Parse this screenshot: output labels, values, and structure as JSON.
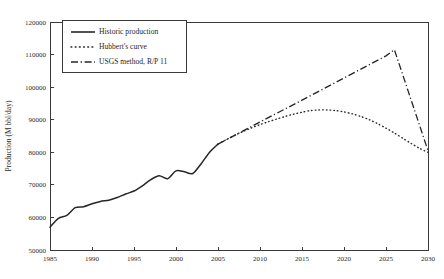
{
  "chart_data": {
    "type": "line",
    "title": "",
    "xlabel": "",
    "ylabel": "Production (M bbl/day)",
    "xlim": [
      1985,
      2030
    ],
    "ylim": [
      50000,
      120000
    ],
    "xticks": [
      1985,
      1990,
      1995,
      2000,
      2005,
      2010,
      2015,
      2020,
      2025,
      2030
    ],
    "xticklabels": [
      "1985",
      "1990",
      "1995",
      "2000",
      "2005",
      "2010",
      "2015",
      "2020",
      "2025",
      "2030"
    ],
    "yticks": [
      50000,
      60000,
      70000,
      80000,
      90000,
      100000,
      110000,
      120000
    ],
    "yticklabels": [
      "50000",
      "60000",
      "70000",
      "80000",
      "90000",
      "100000",
      "110000",
      "120000"
    ],
    "grid": false,
    "legend_position": "upper-left-inset",
    "series": [
      {
        "name": "Historic production",
        "style": "solid",
        "x": [
          1985,
          1986,
          1987,
          1988,
          1989,
          1990,
          1991,
          1992,
          1993,
          1994,
          1995,
          1996,
          1997,
          1998,
          1999,
          2000,
          2001,
          2002,
          2003,
          2004,
          2005
        ],
        "values": [
          57000,
          59700,
          60600,
          63000,
          63300,
          64200,
          64900,
          65300,
          66100,
          67200,
          68100,
          69700,
          71600,
          72800,
          71900,
          74300,
          74000,
          73500,
          76500,
          80000,
          82500
        ]
      },
      {
        "name": "Hubbert's curve",
        "style": "dotted",
        "x": [
          2005,
          2006,
          2007,
          2008,
          2009,
          2010,
          2011,
          2012,
          2013,
          2014,
          2015,
          2016,
          2017,
          2018,
          2019,
          2020,
          2021,
          2022,
          2023,
          2024,
          2025,
          2026,
          2027,
          2028,
          2029,
          2030
        ],
        "values": [
          82500,
          83900,
          85200,
          86400,
          87500,
          88500,
          89400,
          90200,
          91000,
          91700,
          92300,
          92800,
          93000,
          93000,
          92800,
          92400,
          91800,
          91000,
          90000,
          88800,
          87400,
          85900,
          84300,
          82700,
          81200,
          80000
        ]
      },
      {
        "name": "USGS method, R/P 11",
        "style": "dash-dot",
        "x": [
          2005,
          2010,
          2015,
          2020,
          2025,
          2026,
          2030
        ],
        "values": [
          82500,
          89300,
          96000,
          102800,
          109600,
          111500,
          80500
        ]
      }
    ],
    "annotations": []
  },
  "legend": {
    "entries": [
      {
        "label": "Historic production",
        "style": "solid"
      },
      {
        "label": "Hubbert's curve",
        "style": "dotted"
      },
      {
        "label": "USGS method, R/P 11",
        "style": "dash-dot"
      }
    ]
  },
  "caption": {
    "text": ""
  }
}
